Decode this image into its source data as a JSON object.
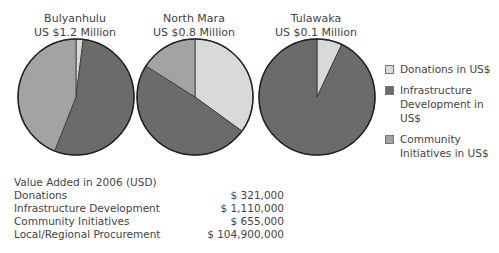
{
  "chart_data": [
    {
      "type": "pie",
      "title": "Bulyanhulu",
      "subtitle": "US $1.2 Million",
      "categories": [
        "Donations in US$",
        "Infrastructure Development in US$",
        "Community Initiatives in US$"
      ],
      "values_percent": [
        2,
        54,
        44
      ]
    },
    {
      "type": "pie",
      "title": "North Mara",
      "subtitle": "US $0.8 Million",
      "categories": [
        "Donations in US$",
        "Infrastructure Development in US$",
        "Community Initiatives in US$"
      ],
      "values_percent": [
        35,
        49,
        16
      ]
    },
    {
      "type": "pie",
      "title": "Tulawaka",
      "subtitle": "US $0.1 Million",
      "categories": [
        "Donations in US$",
        "Infrastructure Development in US$",
        "Community Initiatives in US$"
      ],
      "values_percent": [
        7,
        93,
        0
      ]
    },
    {
      "type": "table",
      "title": "Value Added in 2006 (USD)",
      "rows": [
        {
          "label": "Donations",
          "value": "$ 321,000"
        },
        {
          "label": "Infrastructure Development",
          "value": "$ 1,110,000"
        },
        {
          "label": "Community Initiatives",
          "value": "$ 655,000"
        },
        {
          "label": "Local/Regional Procurement",
          "value": "$ 104,900,000"
        }
      ]
    }
  ],
  "pies": [
    {
      "name": "Bulyanhulu",
      "amount": "US $1.2 Million"
    },
    {
      "name": "North Mara",
      "amount": "US $0.8 Million"
    },
    {
      "name": "Tulawaka",
      "amount": "US $0.1 Million"
    }
  ],
  "legend": [
    {
      "label": "Donations in US$",
      "color": "#d9d9d9"
    },
    {
      "label": "Infrastructure Development in US$",
      "color": "#6b6b6b"
    },
    {
      "label": "Community Initiatives in US$",
      "color": "#a3a3a3"
    }
  ],
  "table": {
    "heading": "Value Added in 2006 (USD)",
    "rows": [
      {
        "label": "Donations",
        "value": "$ 321,000"
      },
      {
        "label": "Infrastructure Development",
        "value": "$ 1,110,000"
      },
      {
        "label": "Community Initiatives",
        "value": "$ 655,000"
      },
      {
        "label": "Local/Regional Procurement",
        "value": "$ 104,900,000"
      }
    ]
  }
}
